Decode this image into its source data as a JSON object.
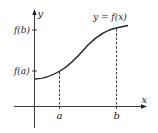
{
  "diagram": {
    "curve_label": "y = f(x)",
    "axes": {
      "x_label": "x",
      "y_label": "y"
    },
    "x_ticks": [
      {
        "label": "a",
        "x": 59
      },
      {
        "label": "b",
        "x": 116
      }
    ],
    "y_ticks": [
      {
        "label": "f(a)",
        "y": 71
      },
      {
        "label": "f(b)",
        "y": 30
      }
    ],
    "colors": {
      "line": "#222222",
      "background": "#ffffff"
    }
  }
}
